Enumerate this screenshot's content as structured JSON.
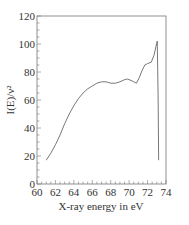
{
  "chart_data": {
    "type": "line",
    "title": "",
    "xlabel": "X-ray energy in eV",
    "ylabel": "I(E)/ν²",
    "xlim": [
      60,
      74
    ],
    "ylim": [
      0,
      120
    ],
    "x_ticks": [
      60,
      62,
      64,
      66,
      68,
      70,
      72,
      74
    ],
    "y_ticks": [
      0,
      20,
      40,
      60,
      80,
      100,
      120
    ],
    "x_tick_labels": [
      "60",
      "62",
      "64",
      "66",
      "68",
      "70",
      "72",
      "74"
    ],
    "y_tick_labels": [
      "0",
      "20",
      "40",
      "60",
      "80",
      "100",
      "120"
    ],
    "grid": false,
    "legend": null,
    "frame": "box",
    "series": [
      {
        "name": "I(E)/ν²",
        "color": "#555555",
        "x": [
          61.0,
          61.5,
          62.0,
          62.5,
          63.0,
          63.5,
          64.0,
          64.5,
          65.0,
          65.5,
          66.0,
          66.5,
          67.0,
          67.5,
          68.0,
          68.5,
          69.0,
          69.5,
          69.8,
          70.2,
          70.5,
          70.8,
          71.1,
          71.4,
          71.7,
          72.0,
          72.4,
          72.7,
          72.9,
          73.05,
          73.15,
          73.2
        ],
        "y": [
          17,
          22,
          28,
          35,
          43,
          50,
          56,
          61,
          65,
          68,
          70,
          72,
          73,
          73,
          72,
          72,
          73,
          74.5,
          75,
          74,
          73,
          72,
          76,
          81,
          85,
          86,
          87,
          92,
          98,
          102,
          60,
          17
        ]
      }
    ]
  }
}
